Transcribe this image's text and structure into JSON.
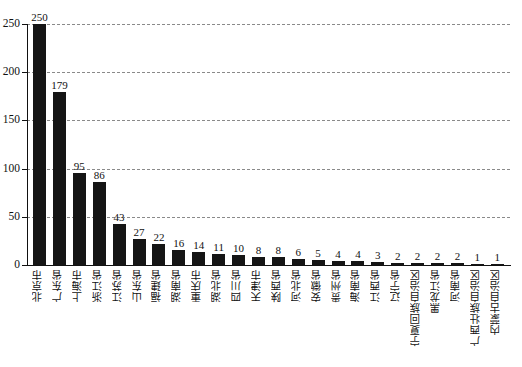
{
  "chart_data": {
    "type": "bar",
    "title": "",
    "subtitle": "",
    "xlabel": "",
    "ylabel": "",
    "ylim": [
      0,
      250
    ],
    "yticks": [
      0,
      50,
      100,
      150,
      200,
      250
    ],
    "grid": "horizontal-dashed",
    "legend": "none",
    "bar_color": "#151515",
    "categories": [
      "北京市",
      "广东省",
      "上海市",
      "浙江省",
      "江苏省",
      "山东省",
      "福建省",
      "湖南省",
      "重庆市",
      "湖北省",
      "四川省",
      "天津市",
      "陕西省",
      "河北省",
      "安徽省",
      "贵州省",
      "海南省",
      "江西省",
      "辽宁省",
      "宁夏回族自治区",
      "黑龙江省",
      "河南省",
      "广西壮族自治区",
      "内蒙古自治区"
    ],
    "values": [
      250,
      179,
      95,
      86,
      43,
      27,
      22,
      16,
      14,
      11,
      10,
      8,
      8,
      6,
      5,
      4,
      4,
      3,
      2,
      2,
      2,
      2,
      1,
      1
    ]
  }
}
